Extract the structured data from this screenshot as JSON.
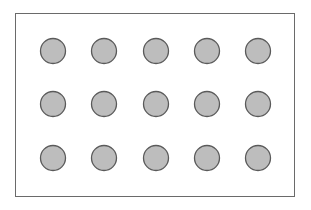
{
  "diagram": {
    "rows": 3,
    "cols": 5,
    "circle_fill": "#bdbdbd",
    "circle_stroke": "#5a5a5a",
    "circle_radius": 12.5,
    "col_centers": [
      53,
      104,
      156,
      207,
      258
    ],
    "row_centers": [
      51,
      104,
      158
    ]
  }
}
